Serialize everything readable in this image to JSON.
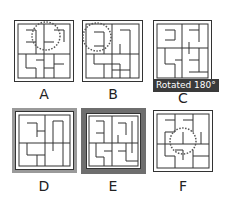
{
  "figure": {
    "type": "visual-puzzle-options",
    "options": [
      {
        "id": "A",
        "label": "A",
        "annotation": "dotted circle at top-center"
      },
      {
        "id": "B",
        "label": "B",
        "annotation": "dotted circle at top-left"
      },
      {
        "id": "C",
        "label": "C",
        "annotation": "Rotated 180°"
      },
      {
        "id": "D",
        "label": "D",
        "annotation": "light gray double frame"
      },
      {
        "id": "E",
        "label": "E",
        "annotation": "thick dark gray frame"
      },
      {
        "id": "F",
        "label": "F",
        "annotation": "dotted circle at center"
      }
    ],
    "badge_text": "Rotated 180°",
    "colors": {
      "line": "#333333",
      "badge_bg": "#3a3a3a",
      "badge_text": "#ffffff",
      "frame_d": "#9a9a9a",
      "frame_e": "#6e6e6e"
    }
  }
}
